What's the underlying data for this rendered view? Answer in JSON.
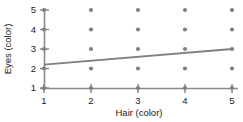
{
  "chart_data": {
    "type": "scatter",
    "title": "",
    "xlabel": "Hair (color)",
    "ylabel": "Eyes (color)",
    "xlim": [
      1,
      5
    ],
    "ylim": [
      1,
      5
    ],
    "xticks": [
      1,
      2,
      3,
      4,
      5
    ],
    "yticks": [
      1,
      2,
      3,
      4,
      5
    ],
    "xtick_labels": [
      "1",
      "2",
      "3",
      "4",
      "5"
    ],
    "ytick_labels": [
      "1",
      "2",
      "3",
      "4",
      "5"
    ],
    "grid": false,
    "legend": "none",
    "point_color": "#808080",
    "line_color": "#808080",
    "axis_color": "#808080",
    "points": [
      {
        "x": 1,
        "y": 1
      },
      {
        "x": 1,
        "y": 2
      },
      {
        "x": 1,
        "y": 3
      },
      {
        "x": 1,
        "y": 4
      },
      {
        "x": 1,
        "y": 5
      },
      {
        "x": 2,
        "y": 1
      },
      {
        "x": 2,
        "y": 2
      },
      {
        "x": 2,
        "y": 3
      },
      {
        "x": 2,
        "y": 4
      },
      {
        "x": 2,
        "y": 5
      },
      {
        "x": 3,
        "y": 1
      },
      {
        "x": 3,
        "y": 2
      },
      {
        "x": 3,
        "y": 3
      },
      {
        "x": 3,
        "y": 4
      },
      {
        "x": 3,
        "y": 5
      },
      {
        "x": 4,
        "y": 1
      },
      {
        "x": 4,
        "y": 2
      },
      {
        "x": 4,
        "y": 3
      },
      {
        "x": 4,
        "y": 4
      },
      {
        "x": 4,
        "y": 5
      },
      {
        "x": 5,
        "y": 1
      },
      {
        "x": 5,
        "y": 2
      },
      {
        "x": 5,
        "y": 3
      },
      {
        "x": 5,
        "y": 4
      },
      {
        "x": 5,
        "y": 5
      }
    ],
    "fit_line": {
      "name": "regression line",
      "x": [
        1,
        5
      ],
      "y": [
        2.2,
        3.0
      ]
    }
  }
}
